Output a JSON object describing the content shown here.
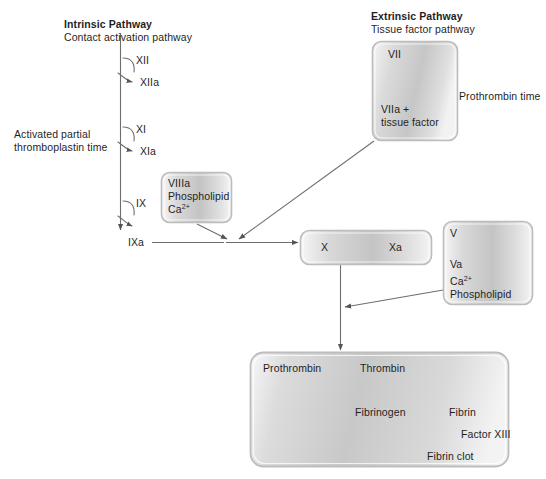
{
  "figure": {
    "background_color": "#ffffff",
    "line_color": "#6e6e6e",
    "text_color": "#1f1f1f",
    "box_border_color": "#b9b9b9",
    "box_fill_light": "#f2f2f2",
    "box_fill_mid": "#c9c9c9"
  },
  "headings": {
    "intrinsic_title": "Intrinsic Pathway",
    "intrinsic_subtitle": "Contact activation pathway",
    "extrinsic_title": "Extrinsic Pathway",
    "extrinsic_subtitle": "Tissue factor pathway"
  },
  "side_labels": {
    "aptt_line1": "Activated partial",
    "aptt_line2": "thromboplastin time",
    "prothrombin_time": "Prothrombin time"
  },
  "intrinsic_chain": {
    "factor_12": "XII",
    "factor_12a": "XIIa",
    "factor_11": "XI",
    "factor_11a": "XIa",
    "factor_9": "IX",
    "factor_9a": "IXa"
  },
  "extrinsic_box": {
    "factor_7": "VII",
    "factor_7a_line1": "VIIa +",
    "factor_7a_line2": "tissue factor"
  },
  "tenase_box": {
    "factor_8a": "VIIIa",
    "phospholipid": "Phospholipid",
    "calcium": "Ca",
    "calcium_sup": "2+"
  },
  "factor_x_box": {
    "factor_10": "X",
    "factor_10a": "Xa"
  },
  "prothrombinase_box": {
    "factor_5": "V",
    "factor_5a": "Va",
    "calcium": "Ca",
    "calcium_sup": "2+",
    "phospholipid": "Phospholipid"
  },
  "common_pathway_box": {
    "prothrombin": "Prothrombin",
    "thrombin": "Thrombin",
    "fibrinogen": "Fibrinogen",
    "fibrin": "Fibrin",
    "factor_13": "Factor XIII",
    "fibrin_clot": "Fibrin clot"
  }
}
